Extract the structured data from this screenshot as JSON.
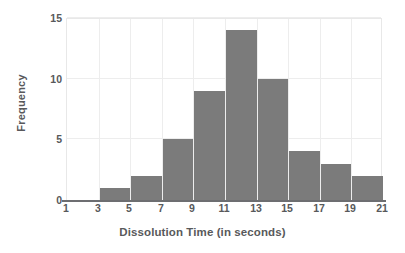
{
  "chart_data": {
    "type": "bar",
    "title": "",
    "subtitle": "",
    "xlabel": "Dissolution Time (in seconds)",
    "ylabel": "Frequency",
    "xlim": [
      1,
      21
    ],
    "ylim": [
      0,
      15
    ],
    "grid": true,
    "legend": null,
    "bin_width": 2,
    "categories": [
      "1-3",
      "3-5",
      "5-7",
      "7-9",
      "9-11",
      "11-13",
      "13-15",
      "15-17",
      "17-19",
      "19-21"
    ],
    "bin_edges": [
      1,
      3,
      5,
      7,
      9,
      11,
      13,
      15,
      17,
      19,
      21
    ],
    "values": [
      0,
      1,
      2,
      5,
      9,
      14,
      10,
      4,
      3,
      2
    ],
    "bars": [
      {
        "start": 1,
        "end": 3,
        "value": 0
      },
      {
        "start": 3,
        "end": 5,
        "value": 1
      },
      {
        "start": 5,
        "end": 7,
        "value": 2
      },
      {
        "start": 7,
        "end": 9,
        "value": 5
      },
      {
        "start": 9,
        "end": 11,
        "value": 9
      },
      {
        "start": 11,
        "end": 13,
        "value": 14
      },
      {
        "start": 13,
        "end": 15,
        "value": 10
      },
      {
        "start": 15,
        "end": 17,
        "value": 4
      },
      {
        "start": 17,
        "end": 19,
        "value": 3
      },
      {
        "start": 19,
        "end": 21,
        "value": 2
      }
    ],
    "x_ticks": [
      1,
      3,
      5,
      7,
      9,
      11,
      13,
      15,
      17,
      19,
      21
    ],
    "x_tick_labels": [
      "1",
      "3",
      "5",
      "7",
      "9",
      "11",
      "13",
      "15",
      "17",
      "19",
      "21"
    ],
    "y_ticks": [
      0,
      5,
      10,
      15
    ],
    "y_tick_labels": [
      "0",
      "5",
      "10",
      "15"
    ],
    "colors": {
      "bar_fill": "#7b7b7b",
      "gridline": "#ededed",
      "axis_line": "#6d6e71",
      "text": "#58595b",
      "background": "#ffffff",
      "plot_border": "#e8e8e8"
    }
  }
}
